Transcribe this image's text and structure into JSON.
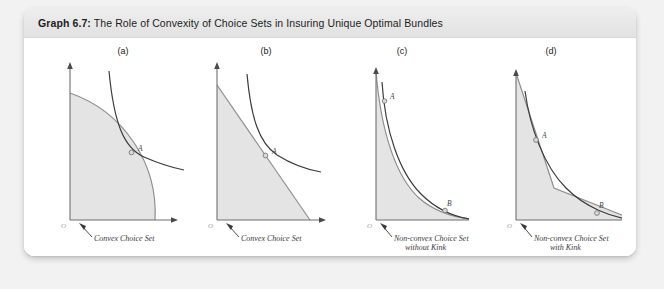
{
  "figure": {
    "label": "Graph 6.7:",
    "title": "The Role of Convexity of Choice Sets in Insuring Unique Optimal Bundles"
  },
  "colors": {
    "page_background": "#f2f2f2",
    "card_background": "#ffffff",
    "header_background": "#e8e8e8",
    "set_fill": "#e4e4e4",
    "set_border": "#8f8f8f",
    "axis": "#6f6f6f",
    "indifference_curve": "#3c3c3c",
    "caption_text": "#3a3a3a",
    "origin_text": "#9a9a9a"
  },
  "panels": [
    {
      "key": "a",
      "label": "(a)",
      "origin_label": "O",
      "caption_lines": [
        "Convex Choice Set"
      ],
      "points": [
        "A"
      ],
      "set_shape": "quarter-disc",
      "convexity": "convex",
      "tangency_count": 1
    },
    {
      "key": "b",
      "label": "(b)",
      "origin_label": "O",
      "caption_lines": [
        "Convex Choice Set"
      ],
      "points": [
        "A"
      ],
      "set_shape": "triangle",
      "convexity": "convex",
      "tangency_count": 1
    },
    {
      "key": "c",
      "label": "(c)",
      "origin_label": "O",
      "caption_lines": [
        "Non-convex Choice Set",
        "without Kink"
      ],
      "points": [
        "A",
        "B"
      ],
      "set_shape": "concave-curve",
      "convexity": "non-convex",
      "tangency_count": 2
    },
    {
      "key": "d",
      "label": "(d)",
      "origin_label": "O",
      "caption_lines": [
        "Non-convex Choice Set",
        "with Kink"
      ],
      "points": [
        "A",
        "B"
      ],
      "set_shape": "kinked-piecewise-linear",
      "convexity": "non-convex",
      "tangency_count": 2
    }
  ]
}
